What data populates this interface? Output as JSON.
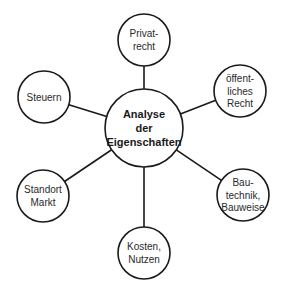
{
  "diagram": {
    "type": "mind-map",
    "center": {
      "id": "analyse",
      "lines": [
        "Analyse",
        "der",
        "Eigenschaften"
      ],
      "cx": 144,
      "cy": 128,
      "r": 39
    },
    "nodes": [
      {
        "id": "privatrecht",
        "lines": [
          "Privat-",
          "recht"
        ],
        "cx": 144,
        "cy": 40,
        "r": 26
      },
      {
        "id": "oeffentliches-recht",
        "lines": [
          "öffent-",
          "liches",
          "Recht"
        ],
        "cx": 240,
        "cy": 91,
        "r": 26
      },
      {
        "id": "bautechnik",
        "lines": [
          "Bau-",
          "technik,",
          "Bauweise"
        ],
        "cx": 243,
        "cy": 195,
        "r": 26
      },
      {
        "id": "kosten-nutzen",
        "lines": [
          "Kosten,",
          "Nutzen"
        ],
        "cx": 144,
        "cy": 253,
        "r": 26
      },
      {
        "id": "standort-markt",
        "lines": [
          "Standort",
          "Markt"
        ],
        "cx": 43,
        "cy": 196,
        "r": 26
      },
      {
        "id": "steuern",
        "lines": [
          "Steuern"
        ],
        "cx": 44,
        "cy": 97,
        "r": 26
      }
    ],
    "edges": [
      {
        "from": "analyse",
        "to": "privatrecht"
      },
      {
        "from": "analyse",
        "to": "oeffentliches-recht"
      },
      {
        "from": "analyse",
        "to": "bautechnik"
      },
      {
        "from": "analyse",
        "to": "kosten-nutzen"
      },
      {
        "from": "analyse",
        "to": "standort-markt"
      },
      {
        "from": "analyse",
        "to": "steuern"
      }
    ],
    "colors": {
      "stroke": "#1a1a1a",
      "fill": "#ffffff",
      "text": "#2a2a2a"
    }
  }
}
